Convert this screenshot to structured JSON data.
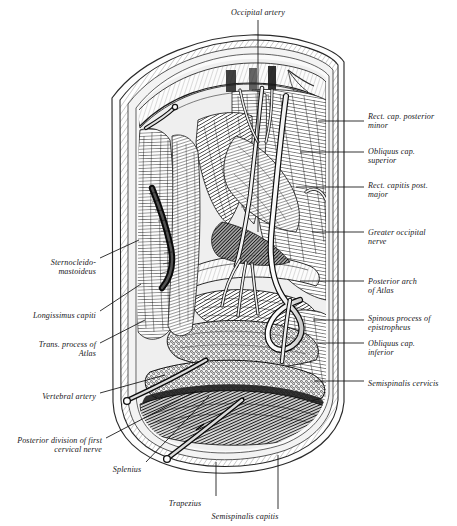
{
  "figure": {
    "background_color": "#ffffff",
    "ink_color": "#1b1b1b"
  },
  "labels": {
    "top": [
      {
        "id": "occipital-artery",
        "text": "Occipital artery",
        "align": "center",
        "x": 258,
        "y": 8,
        "leader": {
          "x1": 258,
          "y1": 20,
          "x2": 258,
          "y2": 232
        }
      }
    ],
    "right": [
      {
        "id": "rect-cap-posterior-minor",
        "text": "Rect. cap. posterior\nminor",
        "align": "left",
        "x": 368,
        "y": 112,
        "leader": {
          "x1": 318,
          "y1": 121,
          "x2": 364,
          "y2": 121
        }
      },
      {
        "id": "obliquus-cap-superior",
        "text": "Obliquus cap.\nsuperior",
        "align": "left",
        "x": 368,
        "y": 147,
        "leader": {
          "x1": 300,
          "y1": 152,
          "x2": 364,
          "y2": 152
        }
      },
      {
        "id": "rect-capitis-post-major",
        "text": "Rect. capitis post.\nmajor",
        "align": "left",
        "x": 368,
        "y": 181,
        "leader": {
          "x1": 296,
          "y1": 187,
          "x2": 364,
          "y2": 187
        }
      },
      {
        "id": "greater-occipital-nerve",
        "text": "Greater occipital\nnerve",
        "align": "left",
        "x": 368,
        "y": 228,
        "leader": {
          "x1": 312,
          "y1": 232,
          "x2": 364,
          "y2": 232
        }
      },
      {
        "id": "posterior-arch-of-atlas",
        "text": "Posterior arch\nof Atlas",
        "align": "left",
        "x": 368,
        "y": 277,
        "leader": {
          "x1": 300,
          "y1": 281,
          "x2": 364,
          "y2": 281
        }
      },
      {
        "id": "spinous-process-of-epistropheus",
        "text": "Spinous process of\nepistropheus",
        "align": "left",
        "x": 368,
        "y": 314,
        "leader": {
          "x1": 313,
          "y1": 320,
          "x2": 364,
          "y2": 320
        }
      },
      {
        "id": "obliquus-cap-inferior",
        "text": "Obliquus cap.\ninferior",
        "align": "left",
        "x": 368,
        "y": 339,
        "leader": {
          "x1": 318,
          "y1": 343,
          "x2": 364,
          "y2": 343
        }
      },
      {
        "id": "semispinalis-cervicis",
        "text": "Semispinalis cervicis",
        "align": "left",
        "x": 368,
        "y": 379,
        "leader": {
          "x1": 314,
          "y1": 381,
          "x2": 364,
          "y2": 381
        }
      }
    ],
    "left": [
      {
        "id": "sternocleido-mastoideus",
        "text": "Sternocleido-\nmastoideus",
        "align": "right",
        "x": 96,
        "y": 258,
        "leader": {
          "x1": 100,
          "y1": 258,
          "x2": 139,
          "y2": 240
        }
      },
      {
        "id": "longissimus-capiti",
        "text": "Longissimus capiti",
        "align": "right",
        "x": 96,
        "y": 311,
        "leader": {
          "x1": 100,
          "y1": 311,
          "x2": 141,
          "y2": 284
        }
      },
      {
        "id": "trans-process-of-atlas",
        "text": "Trans. process of\nAtlas",
        "align": "right",
        "x": 96,
        "y": 340,
        "leader": {
          "x1": 100,
          "y1": 343,
          "x2": 145,
          "y2": 320
        }
      },
      {
        "id": "vertebral-artery",
        "text": "Vertebral artery",
        "align": "right",
        "x": 96,
        "y": 392,
        "leader": {
          "x1": 100,
          "y1": 393,
          "x2": 165,
          "y2": 375
        }
      },
      {
        "id": "posterior-division-of-first-cervical-nerve",
        "text": "Posterior division of first\ncervical nerve",
        "align": "right",
        "x": 102,
        "y": 436,
        "leader": {
          "x1": 106,
          "y1": 438,
          "x2": 196,
          "y2": 391
        }
      }
    ],
    "bottom": [
      {
        "id": "splenius",
        "text": "Splenius",
        "align": "center",
        "x": 127,
        "y": 465,
        "leader": {
          "x1": 146,
          "y1": 462,
          "x2": 209,
          "y2": 396
        }
      },
      {
        "id": "trapezius",
        "text": "Trapezius",
        "align": "center",
        "x": 185,
        "y": 499,
        "leader": {
          "x1": 216,
          "y1": 496,
          "x2": 216,
          "y2": 462
        }
      },
      {
        "id": "semispinalis-capitis",
        "text": "Semispinalis capitis",
        "align": "center",
        "x": 245,
        "y": 512,
        "leader": {
          "x1": 278,
          "y1": 509,
          "x2": 278,
          "y2": 455
        }
      }
    ]
  }
}
